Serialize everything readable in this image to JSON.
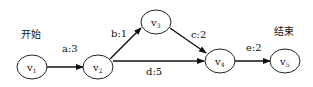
{
  "diagram": {
    "start_label": "开始",
    "end_label": "结束",
    "nodes": [
      {
        "id": "v1",
        "base": "v",
        "sub": "1"
      },
      {
        "id": "v2",
        "base": "v",
        "sub": "2"
      },
      {
        "id": "v3",
        "base": "v",
        "sub": "3"
      },
      {
        "id": "v4",
        "base": "v",
        "sub": "4"
      },
      {
        "id": "v5",
        "base": "v",
        "sub": "5"
      }
    ],
    "edges": [
      {
        "from": "v1",
        "to": "v2",
        "label": "a:3"
      },
      {
        "from": "v2",
        "to": "v3",
        "label": "b:1"
      },
      {
        "from": "v3",
        "to": "v4",
        "label": "c:2"
      },
      {
        "from": "v2",
        "to": "v4",
        "label": "d:5"
      },
      {
        "from": "v4",
        "to": "v5",
        "label": "e:2"
      }
    ]
  }
}
